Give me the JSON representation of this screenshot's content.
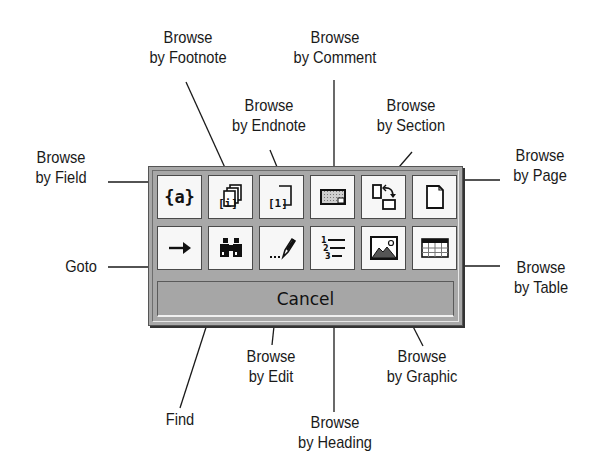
{
  "panel": {
    "cancel_label": "Cancel",
    "row1": [
      {
        "name": "browse-by-field",
        "icon": "field-braces-icon",
        "glyph": "{a}"
      },
      {
        "name": "browse-by-footnote",
        "icon": "footnote-stack-icon"
      },
      {
        "name": "browse-by-endnote",
        "icon": "endnote-icon"
      },
      {
        "name": "browse-by-comment",
        "icon": "comment-icon"
      },
      {
        "name": "browse-by-section",
        "icon": "section-icon"
      },
      {
        "name": "browse-by-page",
        "icon": "page-icon"
      }
    ],
    "row2": [
      {
        "name": "goto",
        "icon": "arrow-right-icon",
        "glyph": "→"
      },
      {
        "name": "find",
        "icon": "binoculars-icon"
      },
      {
        "name": "browse-by-edit",
        "icon": "pencil-icon"
      },
      {
        "name": "browse-by-heading",
        "icon": "numbered-list-icon"
      },
      {
        "name": "browse-by-graphic",
        "icon": "picture-icon"
      },
      {
        "name": "browse-by-table",
        "icon": "table-icon"
      }
    ]
  },
  "callouts": {
    "field": {
      "line1": "Browse",
      "line2": "by Field"
    },
    "footnote": {
      "line1": "Browse",
      "line2": "by Footnote"
    },
    "endnote": {
      "line1": "Browse",
      "line2": "by Endnote"
    },
    "comment": {
      "line1": "Browse",
      "line2": "by Comment"
    },
    "section": {
      "line1": "Browse",
      "line2": "by Section"
    },
    "page": {
      "line1": "Browse",
      "line2": "by Page"
    },
    "goto": {
      "line1": "Goto"
    },
    "table": {
      "line1": "Browse",
      "line2": "by Table"
    },
    "find": {
      "line1": "Find"
    },
    "edit": {
      "line1": "Browse",
      "line2": "by Edit"
    },
    "heading": {
      "line1": "Browse",
      "line2": "by Heading"
    },
    "graphic": {
      "line1": "Browse",
      "line2": "by Graphic"
    }
  },
  "colors": {
    "panel": "#a8a8a8",
    "button_face": "#f7f7f7",
    "line": "#1a1a1a"
  }
}
